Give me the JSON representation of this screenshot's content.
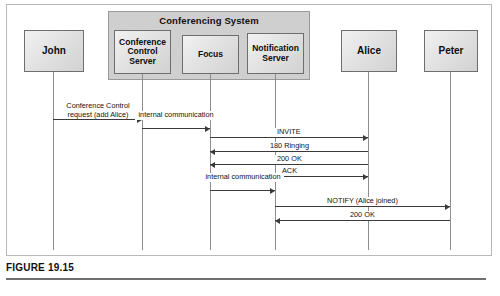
{
  "figure": {
    "caption": "FIGURE 19.15",
    "colors": {
      "system_fill": "#cfcfcf",
      "actor_fill": "#e2e2e2",
      "line": "#3a3a3a",
      "lifeline": "#8d8d8d"
    }
  },
  "system": {
    "title": "Conferencing System",
    "members": [
      "Conference Control Server",
      "Focus",
      "Notification Server"
    ]
  },
  "actors": [
    {
      "id": "john",
      "label": "John",
      "x": 53,
      "box": {
        "left": 24,
        "top": 30,
        "width": 60,
        "height": 42
      }
    },
    {
      "id": "ccs",
      "label": "Conference Control Server",
      "x": 142,
      "box": {
        "left": 114,
        "top": 30,
        "width": 57,
        "height": 44
      }
    },
    {
      "id": "focus",
      "label": "Focus",
      "x": 210,
      "box": {
        "left": 182,
        "top": 35,
        "width": 57,
        "height": 39
      }
    },
    {
      "id": "ns",
      "label": "Notification Server",
      "x": 275,
      "box": {
        "left": 247,
        "top": 33,
        "width": 57,
        "height": 41
      }
    },
    {
      "id": "alice",
      "label": "Alice",
      "x": 368,
      "box": {
        "left": 341,
        "top": 30,
        "width": 56,
        "height": 42
      }
    },
    {
      "id": "peter",
      "label": "Peter",
      "x": 450,
      "box": {
        "left": 424,
        "top": 30,
        "width": 54,
        "height": 42
      }
    }
  ],
  "messages": [
    {
      "id": "m1",
      "label": "Conference Control request (add Alice)",
      "from": "john",
      "to": "ccs",
      "direction": "right",
      "y": 119,
      "two_line": true
    },
    {
      "id": "m2",
      "label": "internal communication",
      "from": "ccs",
      "to": "focus",
      "direction": "right",
      "y": 128,
      "two_line": true
    },
    {
      "id": "m3",
      "label": "INVITE",
      "from": "focus",
      "to": "alice",
      "direction": "right",
      "y": 137,
      "two_line": false
    },
    {
      "id": "m4",
      "label": "180 Ringing",
      "from": "alice",
      "to": "focus",
      "direction": "left",
      "y": 151,
      "two_line": false
    },
    {
      "id": "m5",
      "label": "200 OK",
      "from": "alice",
      "to": "focus",
      "direction": "left",
      "y": 164,
      "two_line": false
    },
    {
      "id": "m6",
      "label": "ACK",
      "from": "focus",
      "to": "alice",
      "direction": "right",
      "y": 176,
      "two_line": false
    },
    {
      "id": "m7",
      "label": "internal communication",
      "from": "focus",
      "to": "ns",
      "direction": "right",
      "y": 190,
      "two_line": true
    },
    {
      "id": "m8",
      "label": "NOTIFY (Alice joined)",
      "from": "ns",
      "to": "peter",
      "direction": "right",
      "y": 206,
      "two_line": false
    },
    {
      "id": "m9",
      "label": "200 OK",
      "from": "peter",
      "to": "ns",
      "direction": "left",
      "y": 220,
      "two_line": false
    }
  ]
}
